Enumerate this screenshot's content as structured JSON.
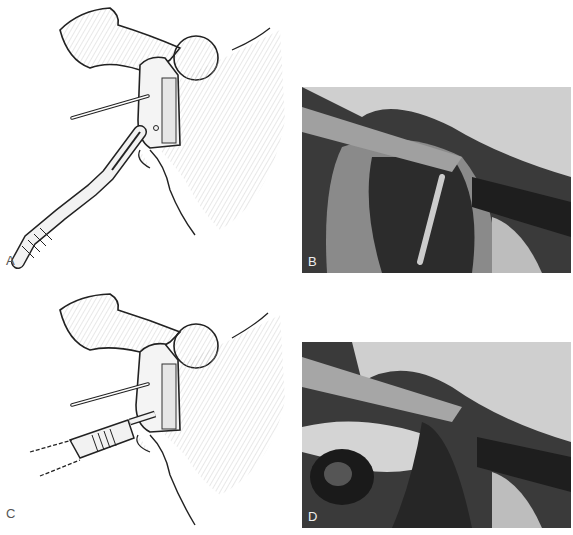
{
  "figure": {
    "panels": [
      {
        "id": "A",
        "label": "A",
        "type": "illustration",
        "description": "line drawing: pin inserted, osteotome cutting bone block"
      },
      {
        "id": "B",
        "label": "B",
        "type": "photograph",
        "description": "intraoperative photo with osteotome and retractors"
      },
      {
        "id": "C",
        "label": "C",
        "type": "illustration",
        "description": "line drawing: pin inserted, power drill/reamer on bone block"
      },
      {
        "id": "D",
        "label": "D",
        "type": "photograph",
        "description": "intraoperative photo with drill held in hand"
      }
    ]
  }
}
